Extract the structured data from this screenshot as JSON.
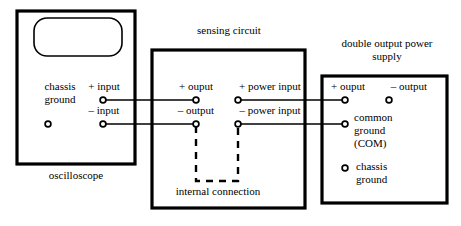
{
  "diagram": {
    "ink_color": "#000000",
    "background": "#ffffff"
  },
  "oscilloscope": {
    "caption": "oscilloscope",
    "screen_name": "crt-screen",
    "chassis_ground_label": "chassis\nground",
    "chassis_ground_line1": "chassis",
    "chassis_ground_line2": "ground",
    "terminals": [
      {
        "label": "+ input",
        "name": "plus-input"
      },
      {
        "label": "– input",
        "name": "minus-input"
      }
    ]
  },
  "sensing_circuit": {
    "caption": "sensing circuit",
    "internal_connection_label": "internal connection",
    "terminals": [
      {
        "label": "+ ouput",
        "name": "plus-output"
      },
      {
        "label": "– output",
        "name": "minus-output"
      },
      {
        "label": "+ power input",
        "name": "plus-power-input"
      },
      {
        "label": "– power input",
        "name": "minus-power-input"
      }
    ]
  },
  "power_supply": {
    "caption_line1": "double output power",
    "caption_line2": "supply",
    "terminals": [
      {
        "label": "+ ouput",
        "name": "plus-output"
      },
      {
        "label": "– output",
        "name": "minus-output"
      }
    ],
    "common_ground_line1": "common",
    "common_ground_line2": "ground",
    "common_ground_line3": "(COM)",
    "chassis_ground_line1": "chassis",
    "chassis_ground_line2": "ground"
  }
}
